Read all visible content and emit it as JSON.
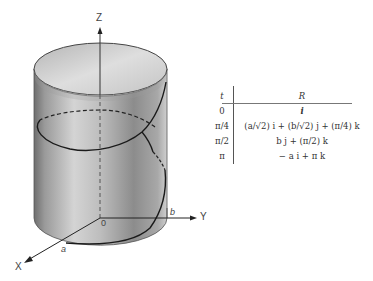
{
  "figure": {
    "axes": {
      "z_label": "Z",
      "y_label": "Y",
      "x_label": "X",
      "origin_label": "0",
      "a_label": "a",
      "b_label": "b"
    },
    "curve": "helix on cylinder of elliptical cross-section (semi-axes a, b)"
  },
  "table": {
    "headers": {
      "t": "t",
      "R": "R"
    },
    "rows": [
      {
        "t": "0",
        "R": "i"
      },
      {
        "t": "π/4",
        "R": "(a/√2) i + (b/√2) j + (π/4) k"
      },
      {
        "t": "π/2",
        "R": "b j + (π/2) k"
      },
      {
        "t": "π",
        "R": "− a i + π k"
      }
    ]
  }
}
